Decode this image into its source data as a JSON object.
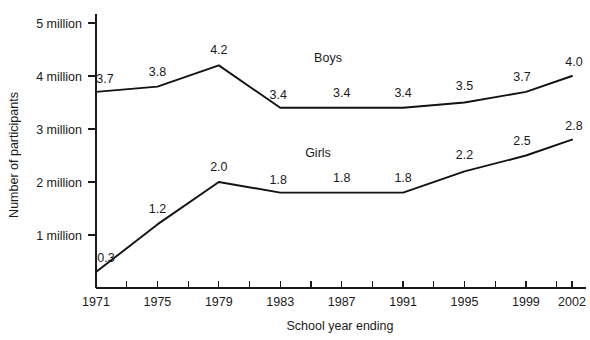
{
  "chart_data": {
    "type": "line",
    "title": "",
    "subtitle": "",
    "xlabel": "School year ending",
    "ylabel": "Number of participants",
    "x": [
      1971,
      1975,
      1979,
      1983,
      1987,
      1991,
      1995,
      1999,
      2002
    ],
    "categories": [
      "1971",
      "1975",
      "1979",
      "1983",
      "1987",
      "1991",
      "1995",
      "1999",
      "2002"
    ],
    "xlim": [
      1971,
      2002
    ],
    "ylim": [
      0,
      5
    ],
    "yticks": [
      1,
      2,
      3,
      4,
      5
    ],
    "ytick_labels": [
      "1 million",
      "2 million",
      "3 million",
      "4 million",
      "5 million"
    ],
    "xtick_labels": [
      "1971",
      "1975",
      "1979",
      "1983",
      "1987",
      "1991",
      "1995",
      "1999",
      "2002"
    ],
    "minor_xticks": [
      "1973",
      "1977",
      "1981",
      "1985",
      "1989",
      "1993",
      "1997",
      "2001"
    ],
    "grid": false,
    "legend_position": "inline-annotation",
    "units": "millions of participants",
    "series": [
      {
        "name": "Boys",
        "color": "#121212",
        "values": [
          3.7,
          3.8,
          4.2,
          3.4,
          3.4,
          3.4,
          3.5,
          3.7,
          4.0
        ],
        "labels": [
          "3.7",
          "3.8",
          "4.2",
          "3.4",
          "3.4",
          "3.4",
          "3.5",
          "3.7",
          "4.0"
        ]
      },
      {
        "name": "Girls",
        "color": "#121212",
        "values": [
          0.3,
          1.2,
          2.0,
          1.8,
          1.8,
          1.8,
          2.2,
          2.5,
          2.8
        ],
        "labels": [
          "0.3",
          "1.2",
          "2.0",
          "1.8",
          "1.8",
          "1.8",
          "2.2",
          "2.5",
          "2.8"
        ]
      }
    ]
  },
  "annotations": {
    "boys_label": "Boys",
    "girls_label": "Girls"
  }
}
